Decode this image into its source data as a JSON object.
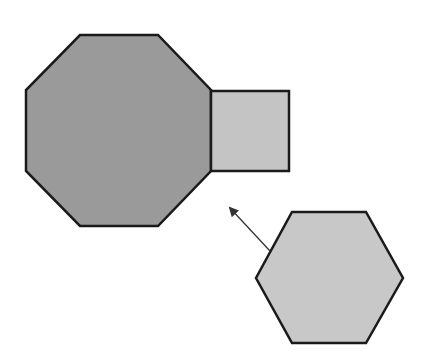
{
  "diagram": {
    "background": "#ffffff",
    "stroke": "#1a1a1a",
    "shapes": [
      {
        "id": "octagon",
        "kind": "regular-octagon",
        "fill": "#9a9a9a",
        "points": "80,35 158,35 211,90 211,171 158,226 80,226 26,171 26,90"
      },
      {
        "id": "square",
        "kind": "square",
        "fill": "#c4c4c4",
        "points": "211,91 289,91 289,171 211,171"
      },
      {
        "id": "hexagon",
        "kind": "regular-hexagon",
        "fill": "#c8c8c8",
        "points": "292,212 366,212 403,278 366,343 292,343 256,278"
      }
    ],
    "arrow": {
      "from": [
        270,
        251
      ],
      "to": [
        230,
        208
      ],
      "color": "#333333"
    }
  }
}
